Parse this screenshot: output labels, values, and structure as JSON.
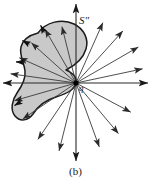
{
  "figure": {
    "caption": "(b)",
    "labels": {
      "region": "S″",
      "point": "q"
    },
    "colors": {
      "background": "#ffffff",
      "region_fill": "#c9c9c9",
      "region_stroke": "#1a1a1a",
      "ray_stroke": "#3a3a3a",
      "axis_stroke": "#2a2a2a",
      "point_marker": "#000000",
      "text": "#1a1a1a"
    },
    "geometry": {
      "width": 151,
      "height": 188,
      "origin": {
        "x": 76,
        "y": 83
      },
      "point_marker_radius": 2.6
    },
    "axes": [
      {
        "name": "axis-up",
        "angle_deg": 90,
        "length": 79
      },
      {
        "name": "axis-down",
        "angle_deg": 270,
        "length": 78
      },
      {
        "name": "axis-left",
        "angle_deg": 180,
        "length": 73
      },
      {
        "name": "axis-right",
        "angle_deg": 0,
        "length": 72
      }
    ],
    "rays": [
      {
        "name": "ray-1",
        "angle_deg": 12,
        "length": 68,
        "terminates_on_region": false
      },
      {
        "name": "ray-2",
        "angle_deg": 30,
        "length": 72,
        "terminates_on_region": false
      },
      {
        "name": "ray-3",
        "angle_deg": 48,
        "length": 70,
        "terminates_on_region": false
      },
      {
        "name": "ray-4",
        "angle_deg": 66,
        "length": 66,
        "terminates_on_region": false
      },
      {
        "name": "ray-5",
        "angle_deg": 104,
        "length": 58,
        "terminates_on_region": true
      },
      {
        "name": "ray-6",
        "angle_deg": 120,
        "length": 62,
        "terminates_on_region": true
      },
      {
        "name": "ray-7",
        "angle_deg": 138,
        "length": 60,
        "terminates_on_region": true
      },
      {
        "name": "ray-8",
        "angle_deg": 156,
        "length": 62,
        "terminates_on_region": true
      },
      {
        "name": "ray-9",
        "angle_deg": 172,
        "length": 66,
        "terminates_on_region": true
      },
      {
        "name": "ray-10",
        "angle_deg": 196,
        "length": 64,
        "terminates_on_region": true
      },
      {
        "name": "ray-11",
        "angle_deg": 214,
        "length": 64,
        "terminates_on_region": false
      },
      {
        "name": "ray-12",
        "angle_deg": 236,
        "length": 68,
        "terminates_on_region": false
      },
      {
        "name": "ray-13",
        "angle_deg": 256,
        "length": 70,
        "terminates_on_region": false
      },
      {
        "name": "ray-14",
        "angle_deg": 290,
        "length": 68,
        "terminates_on_region": false
      },
      {
        "name": "ray-15",
        "angle_deg": 310,
        "length": 66,
        "terminates_on_region": false
      },
      {
        "name": "ray-16",
        "angle_deg": 332,
        "length": 62,
        "terminates_on_region": false
      }
    ],
    "region_path": "M 38 33 C 46 22, 62 18, 74 24 C 84 29, 89 39, 86 49 C 83 59, 74 66, 66 70 C 72 72, 77 77, 76 83 C 75 90, 66 94, 56 97 C 46 100, 38 106, 33 114 C 28 121, 20 122, 15 116 C 10 110, 12 100, 17 93 C 22 86, 26 79, 25 71 C 24 62, 19 55, 21 47 C 23 39, 30 35, 38 33 Z",
    "region_boundary_arrows": [
      {
        "name": "boundary-arrow-top",
        "x": 42,
        "y": 28,
        "angle_deg": 118
      },
      {
        "name": "boundary-arrow-upper-left",
        "x": 25,
        "y": 42,
        "angle_deg": 152
      },
      {
        "name": "boundary-arrow-left",
        "x": 19,
        "y": 62,
        "angle_deg": 178
      },
      {
        "name": "boundary-arrow-lower-left",
        "x": 17,
        "y": 104,
        "angle_deg": 212
      }
    ]
  }
}
